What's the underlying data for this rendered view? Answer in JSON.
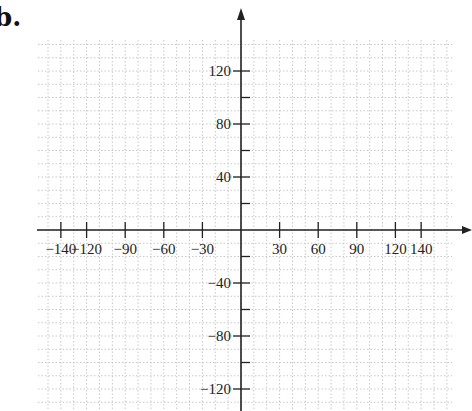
{
  "figure_label": "b.",
  "chart_data": {
    "type": "scatter",
    "title": "",
    "xlabel": "",
    "ylabel": "",
    "x_ticks": [
      -140,
      -120,
      -90,
      -60,
      -30,
      30,
      60,
      90,
      120,
      140
    ],
    "y_ticks_labeled": [
      120,
      80,
      40,
      -40,
      -80,
      -120
    ],
    "y_ticks_minor": [
      100,
      60,
      20,
      -20,
      -60,
      -100
    ],
    "xlim": [
      -157,
      180
    ],
    "ylim": [
      -137,
      168
    ],
    "grid": true,
    "grid_style": "dotted",
    "grid_step_x": 10,
    "grid_step_y": 10,
    "axes_arrows": [
      "x-positive",
      "y-positive"
    ],
    "series": []
  },
  "colors": {
    "axis": "#222222",
    "grid": "#c8c8c8",
    "text": "#222222"
  }
}
